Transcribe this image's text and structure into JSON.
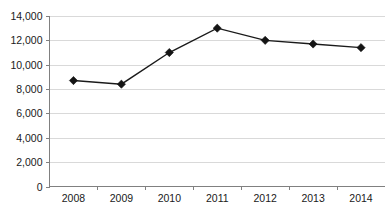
{
  "chart_data": {
    "type": "line",
    "title": "",
    "subtitle": "",
    "xlabel": "",
    "ylabel": "",
    "categories": [
      "2008",
      "2009",
      "2010",
      "2011",
      "2012",
      "2013",
      "2014"
    ],
    "values": [
      8700,
      8400,
      11000,
      13000,
      12000,
      11700,
      11400
    ],
    "series": [
      {
        "name": "",
        "values": [
          8700,
          8400,
          11000,
          13000,
          12000,
          11700,
          11400
        ]
      }
    ],
    "ylim": [
      0,
      14000
    ],
    "yticks": [
      0,
      2000,
      4000,
      6000,
      8000,
      10000,
      12000,
      14000
    ],
    "ytick_labels": [
      "0",
      "2,000",
      "4,000",
      "6,000",
      "8,000",
      "10,000",
      "12,000",
      "14,000"
    ],
    "xtick_labels": [
      "2008",
      "2009",
      "2010",
      "2011",
      "2012",
      "2013",
      "2014"
    ],
    "grid": true,
    "grid_axis": "y",
    "legend": false,
    "legend_position": "none",
    "marker_style": "diamond",
    "line_color": "#1a1a1a",
    "marker_color": "#141414",
    "gridline_color": "#d9d9d9",
    "axis_color": "#808080",
    "background_color": "#ffffff",
    "annotations": []
  },
  "caption": {
    "text": ""
  }
}
